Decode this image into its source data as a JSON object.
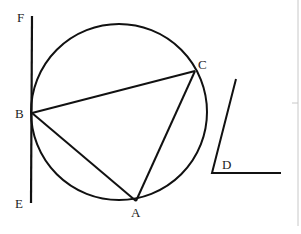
{
  "diagram": {
    "labels": {
      "F": "F",
      "B": "B",
      "E": "E",
      "C": "C",
      "A": "A",
      "D": "D"
    },
    "circle": {
      "cx": 119,
      "cy": 112,
      "r": 88
    },
    "points": {
      "F": [
        32,
        16
      ],
      "B": [
        32,
        113
      ],
      "E": [
        32,
        203
      ],
      "C": [
        195,
        71
      ],
      "A": [
        136,
        201
      ],
      "D": [
        212,
        173
      ]
    },
    "colors": {
      "stroke": "#111111",
      "border": "#c8c8c8"
    }
  }
}
